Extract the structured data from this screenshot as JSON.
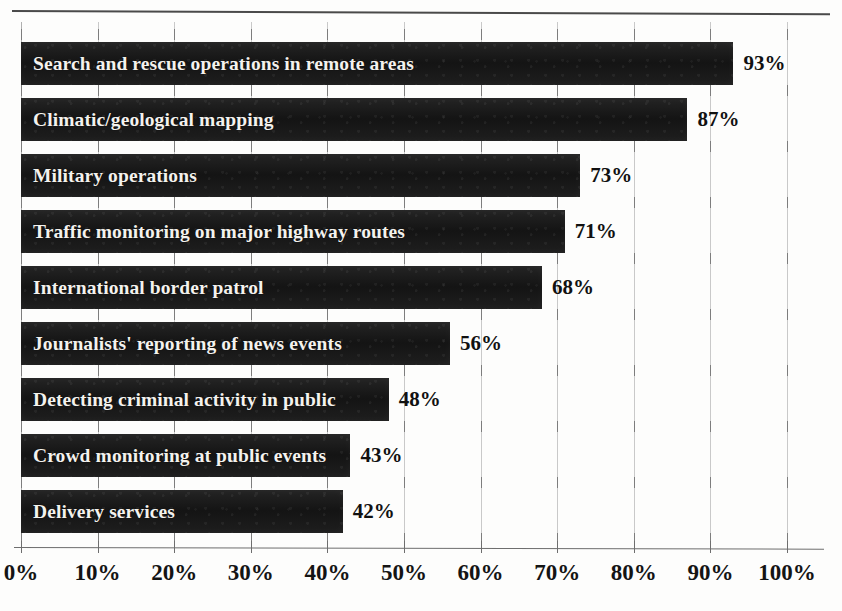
{
  "chart_data": {
    "type": "bar",
    "orientation": "horizontal",
    "title": "",
    "subtitle": "",
    "xlabel": "",
    "ylabel": "",
    "xlim": [
      0,
      100
    ],
    "xticks": [
      0,
      10,
      20,
      30,
      40,
      50,
      60,
      70,
      80,
      90,
      100
    ],
    "xtick_labels": [
      "0%",
      "10%",
      "20%",
      "30%",
      "40%",
      "50%",
      "60%",
      "70%",
      "80%",
      "90%",
      "100%"
    ],
    "grid": true,
    "legend": false,
    "value_suffix": "%",
    "bar_color": "#1b1b1b",
    "label_color": "#f4f2ee",
    "value_color": "#111111",
    "categories": [
      "Search and rescue operations in remote areas",
      "Climatic/geological mapping",
      "Military operations",
      "Traffic monitoring on major highway routes",
      "International border patrol",
      "Journalists' reporting of news events",
      "Detecting criminal activity in public",
      "Crowd monitoring at public events",
      "Delivery services"
    ],
    "values": [
      93,
      87,
      73,
      71,
      68,
      56,
      48,
      43,
      42
    ],
    "value_labels": [
      "93%",
      "87%",
      "73%",
      "71%",
      "68%",
      "56%",
      "48%",
      "43%",
      "42%"
    ],
    "bars": [
      {
        "label": "Search and rescue operations in remote areas",
        "value": 93,
        "value_label": "93%"
      },
      {
        "label": "Climatic/geological mapping",
        "value": 87,
        "value_label": "87%"
      },
      {
        "label": "Military operations",
        "value": 73,
        "value_label": "73%"
      },
      {
        "label": "Traffic monitoring on major highway routes",
        "value": 71,
        "value_label": "71%"
      },
      {
        "label": "International border patrol",
        "value": 68,
        "value_label": "68%"
      },
      {
        "label": "Journalists' reporting of news events",
        "value": 56,
        "value_label": "56%"
      },
      {
        "label": "Detecting criminal activity in public",
        "value": 48,
        "value_label": "48%"
      },
      {
        "label": "Crowd monitoring at public events",
        "value": 43,
        "value_label": "43%"
      },
      {
        "label": "Delivery services",
        "value": 42,
        "value_label": "42%"
      }
    ]
  }
}
